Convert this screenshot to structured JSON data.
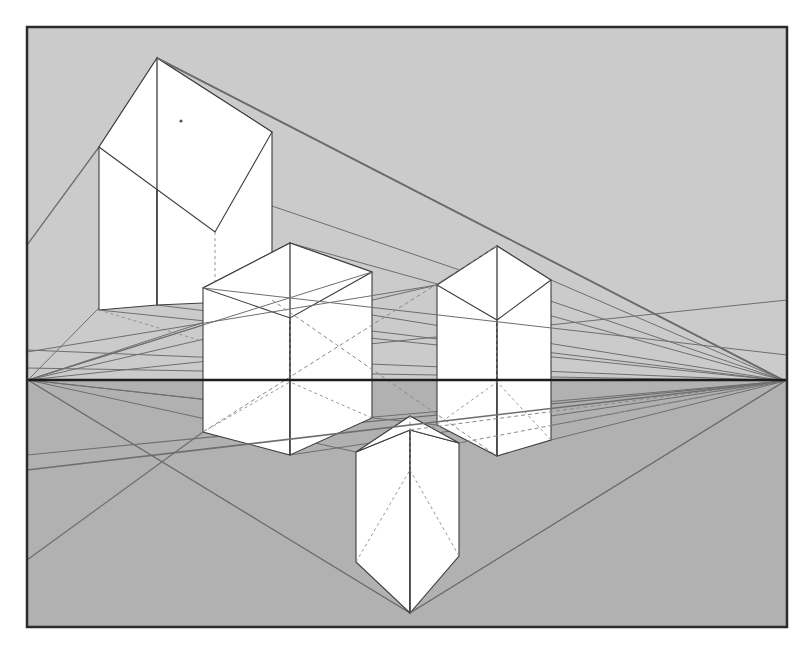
{
  "figure": {
    "canvas": {
      "width": 812,
      "height": 664
    },
    "background_color": "#ffffff",
    "frame": {
      "x": 27,
      "y": 27,
      "width": 760,
      "height": 600,
      "border_color": "#2b2b2b",
      "border_width": 2.5
    },
    "sky_fill": "#cbcbcb",
    "ground_fill": "#b1b1b1",
    "cube_fill": "#ffffff",
    "edge_color": "#3d3d3d",
    "construction_color": "#6e6e6e",
    "hidden_edge_color": "#8a8a8a",
    "horizon": {
      "label": "horizon line",
      "y": 380,
      "x_start": 27,
      "x_end": 787,
      "color": "#1c1c1c",
      "width": 2.6
    },
    "vanishing_points": [
      {
        "name": "left-vanishing-point",
        "x": 28,
        "y": 380
      },
      {
        "name": "right-vanishing-point",
        "x": 785,
        "y": 381
      }
    ],
    "speck": {
      "x": 181,
      "y": 121,
      "r": 1.6,
      "color": "#555555"
    },
    "cubes": [
      {
        "name": "cube-upper-left",
        "apex": [
          157,
          58
        ],
        "front_bottom": [
          157,
          305
        ],
        "left_top": [
          99,
          147
        ],
        "left_bottom": [
          99,
          310
        ],
        "right_top": [
          272,
          132
        ],
        "right_bottom": [
          272,
          300
        ],
        "back_top": [
          215,
          232
        ],
        "back_bottom": [
          215,
          345
        ]
      },
      {
        "name": "cube-center",
        "apex": [
          290,
          243
        ],
        "front_bottom": [
          290,
          455
        ],
        "left_top": [
          203,
          288
        ],
        "left_bottom": [
          203,
          432
        ],
        "right_top": [
          372,
          272
        ],
        "right_bottom": [
          372,
          418
        ],
        "back_top": [
          290,
          318
        ],
        "back_bottom": [
          290,
          382
        ]
      },
      {
        "name": "cube-right",
        "apex": [
          497,
          246
        ],
        "front_bottom": [
          497,
          456
        ],
        "left_top": [
          437,
          285
        ],
        "left_bottom": [
          437,
          425
        ],
        "right_top": [
          551,
          280
        ],
        "right_bottom": [
          551,
          440
        ],
        "back_top": [
          497,
          320
        ],
        "back_bottom": [
          497,
          382
        ]
      },
      {
        "name": "cube-lower-center",
        "apex": [
          410,
          430
        ],
        "front_bottom": [
          410,
          613
        ],
        "left_top": [
          356,
          452
        ],
        "left_bottom": [
          356,
          562
        ],
        "right_top": [
          459,
          443
        ],
        "right_bottom": [
          459,
          556
        ],
        "back_top": [
          410,
          416
        ],
        "back_bottom": [
          410,
          470
        ]
      }
    ],
    "construction_lines_note": "Receding edges and guide rays radiate from both vanishing points on the horizon."
  }
}
